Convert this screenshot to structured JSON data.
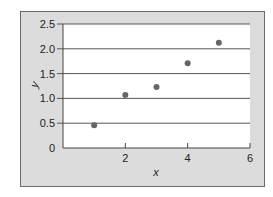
{
  "chart_data": {
    "type": "scatter",
    "title": "",
    "xlabel": "x",
    "ylabel": "y",
    "x": [
      1,
      2,
      3,
      4,
      5
    ],
    "y": [
      0.46,
      1.07,
      1.23,
      1.71,
      2.12
    ],
    "series": [
      {
        "name": "data",
        "x": [
          1,
          2,
          3,
          4,
          5
        ],
        "y": [
          0.46,
          1.07,
          1.23,
          1.71,
          2.12
        ]
      }
    ],
    "xlim": [
      0,
      6
    ],
    "ylim": [
      0,
      2.5
    ],
    "xticks": [
      2,
      4,
      6
    ],
    "xtick_labels": [
      "2",
      "4",
      "6"
    ],
    "yticks": [
      0,
      0.5,
      1.0,
      1.5,
      2.0,
      2.5
    ],
    "ytick_labels": [
      "0",
      "0.5",
      "1.0",
      "1.5",
      "2.0",
      "2.5"
    ],
    "grid": "horizontal",
    "legend": "none"
  },
  "colors": {
    "frame_bg": "#dcdcdc",
    "plot_bg": "#ffffff",
    "gridline": "#555555",
    "marker": "#666666"
  }
}
